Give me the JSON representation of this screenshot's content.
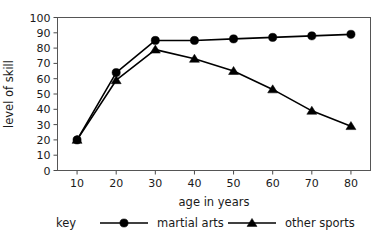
{
  "chart_data": {
    "type": "line",
    "title": "",
    "xlabel": "age in years",
    "ylabel": "level of skill",
    "x": [
      10,
      20,
      30,
      40,
      50,
      60,
      70,
      80
    ],
    "xticks": [
      "10",
      "20",
      "30",
      "40",
      "50",
      "60",
      "70",
      "80"
    ],
    "yticks": [
      "0",
      "10",
      "20",
      "30",
      "40",
      "50",
      "60",
      "70",
      "80",
      "90",
      "100"
    ],
    "xlim": [
      5,
      85
    ],
    "ylim": [
      0,
      100
    ],
    "grid": false,
    "legend_position": "bottom",
    "legend_prefix": "key",
    "series": [
      {
        "name": "martial arts",
        "marker": "circle",
        "color": "#000000",
        "values": [
          20,
          64,
          85,
          85,
          86,
          87,
          88,
          89
        ]
      },
      {
        "name": "other sports",
        "marker": "triangle",
        "color": "#000000",
        "values": [
          20,
          59,
          79,
          73,
          65,
          53,
          39,
          29
        ]
      }
    ]
  },
  "legend": {
    "key_label": "key",
    "entries": [
      {
        "label": "martial arts",
        "marker": "circle-marker"
      },
      {
        "label": "other sports",
        "marker": "triangle-marker"
      }
    ]
  },
  "axes": {
    "x_title": "age in years",
    "y_title": "level of skill"
  }
}
